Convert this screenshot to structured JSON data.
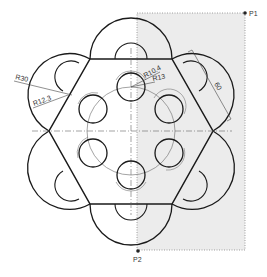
{
  "drawing": {
    "colors": {
      "line": "#1a1a1a",
      "thin": "#555555",
      "shade": "#ececec",
      "background": "#ffffff"
    },
    "points": {
      "p1": {
        "label": "P1",
        "x": 245,
        "y": 13
      },
      "p2": {
        "label": "P2",
        "x": 138,
        "y": 250
      }
    },
    "dimensions": {
      "outer_radius": "R30",
      "inner_arc_radius": "R12.3",
      "hole_radius": "R10.4",
      "hole_offset_radius": "R13",
      "edge_length": "60"
    }
  }
}
